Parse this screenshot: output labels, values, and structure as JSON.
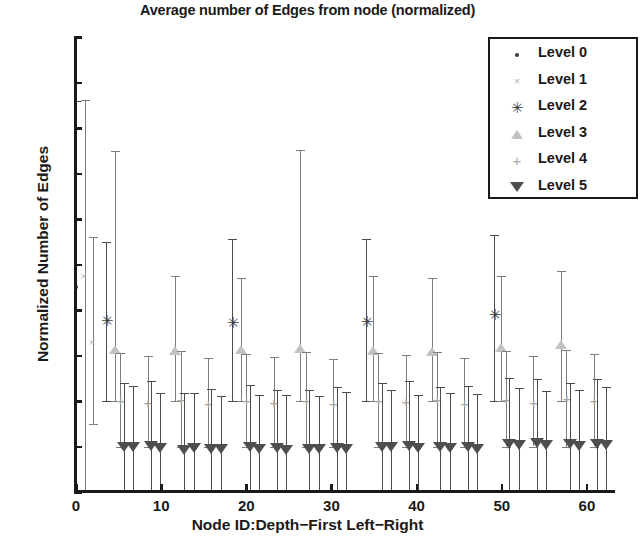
{
  "chart_data": {
    "type": "scatter",
    "title": "Average number of Edges from node (normalized)",
    "xlabel": "Node ID:Depth−First Left−Right",
    "ylabel": "Normalized Number of Edges",
    "xlim": [
      0,
      63.3
    ],
    "ylim": [
      0,
      0.2
    ],
    "xticks": [
      0,
      10,
      20,
      30,
      40,
      50,
      60
    ],
    "xticklabels": [
      "0",
      "10",
      "20",
      "30",
      "40",
      "50",
      "60"
    ],
    "yticks": [
      0,
      0.02,
      0.04,
      0.06,
      0.08,
      0.1,
      0.12,
      0.14,
      0.16,
      0.18,
      0.2
    ],
    "yticklabels": [
      "0",
      "0.02",
      "0.04",
      "0.06",
      "0.08",
      "0.1",
      "0.12",
      "0.14",
      "0.16",
      "0.18",
      "0.2"
    ],
    "grid": false,
    "legend_position": "upper right",
    "error_bars": "vertical, symmetric-ish (std-dev whiskers with caps)",
    "series": [
      {
        "name": "Level 0",
        "marker": "point",
        "color": "#3a3a3a",
        "x": [
          0
        ],
        "y": [
          0.0903
        ],
        "yerr_low": [
          0.0903
        ],
        "yerr_high": [
          0.0817
        ]
      },
      {
        "name": "Level 1",
        "marker": "x",
        "color": "#b4b4b4",
        "x": [
          1,
          2
        ],
        "y": [
          0.0945,
          0.0655
        ],
        "yerr_low": [
          0.0945,
          0.0355
        ],
        "yerr_high": [
          0.078,
          0.0465
        ]
      },
      {
        "name": "Level 2",
        "marker": "asterisk",
        "color": "#3c3c3c",
        "x": [
          3.5,
          18.3,
          34.0,
          49.1
        ],
        "y": [
          0.0752,
          0.0745,
          0.0748,
          0.0778
        ],
        "yerr_low": [
          0.0352,
          0.0345,
          0.0348,
          0.0378
        ],
        "yerr_high": [
          0.0348,
          0.0365,
          0.0362,
          0.0352
        ]
      },
      {
        "name": "Level 3",
        "marker": "triangle-up",
        "color": "#c2c2c2",
        "x": [
          4.6,
          11.6,
          19.4,
          26.3,
          34.9,
          41.8,
          49.9,
          57.0
        ],
        "y": [
          0.0625,
          0.0618,
          0.0622,
          0.063,
          0.062,
          0.0615,
          0.0635,
          0.0648
        ],
        "yerr_low": [
          0.0225,
          0.0218,
          0.0222,
          0.023,
          0.022,
          0.0215,
          0.0235,
          0.0248
        ],
        "yerr_high": [
          0.0875,
          0.0332,
          0.0318,
          0.0875,
          0.033,
          0.0325,
          0.0315,
          0.0322
        ]
      },
      {
        "name": "Level 4",
        "marker": "plus",
        "color": "#a8a8a8",
        "x": [
          5.2,
          8.4,
          12.3,
          15.5,
          20.0,
          23.2,
          27.0,
          30.2,
          35.5,
          38.7,
          42.4,
          45.6,
          50.5,
          53.7,
          57.6,
          60.8
        ],
        "y": [
          0.04,
          0.0392,
          0.0405,
          0.0388,
          0.0398,
          0.039,
          0.0402,
          0.0385,
          0.04,
          0.0395,
          0.0403,
          0.0388,
          0.0405,
          0.0392,
          0.0408,
          0.0398
        ],
        "yerr_low": [
          0.02,
          0.0192,
          0.0205,
          0.0188,
          0.0198,
          0.019,
          0.0202,
          0.0185,
          0.02,
          0.0195,
          0.0203,
          0.0188,
          0.0205,
          0.0192,
          0.0208,
          0.0198
        ],
        "yerr_high": [
          0.021,
          0.0205,
          0.0215,
          0.02,
          0.0208,
          0.0202,
          0.0212,
          0.0198,
          0.021,
          0.0206,
          0.0213,
          0.02,
          0.0215,
          0.0204,
          0.0217,
          0.021
        ]
      },
      {
        "name": "Level 5",
        "marker": "triangle-down",
        "color": "#4e4e4e",
        "x": [
          5.6,
          6.7,
          8.8,
          9.9,
          12.7,
          13.8,
          15.9,
          17.0,
          20.4,
          21.5,
          23.6,
          24.7,
          27.4,
          28.5,
          30.6,
          31.7,
          35.9,
          37.0,
          39.1,
          40.2,
          42.8,
          43.9,
          46.0,
          47.1,
          50.9,
          52.0,
          54.1,
          55.2,
          58.0,
          59.1,
          61.2,
          62.3
        ],
        "y": [
          0.02,
          0.0196,
          0.0202,
          0.0194,
          0.0186,
          0.0192,
          0.0188,
          0.019,
          0.0196,
          0.0188,
          0.0192,
          0.0186,
          0.019,
          0.0188,
          0.0192,
          0.019,
          0.02,
          0.0196,
          0.0202,
          0.0194,
          0.0198,
          0.0192,
          0.0196,
          0.019,
          0.0212,
          0.0208,
          0.0214,
          0.0206,
          0.021,
          0.0204,
          0.0212,
          0.0208
        ],
        "yerr_low": [
          0.02,
          0.0196,
          0.0202,
          0.0194,
          0.0186,
          0.0192,
          0.0188,
          0.019,
          0.0196,
          0.0188,
          0.0192,
          0.0186,
          0.019,
          0.0188,
          0.0192,
          0.019,
          0.02,
          0.0196,
          0.0202,
          0.0194,
          0.0198,
          0.0192,
          0.0196,
          0.019,
          0.0212,
          0.0208,
          0.0214,
          0.0206,
          0.021,
          0.0204,
          0.0212,
          0.0208
        ],
        "yerr_high": [
          0.028,
          0.027,
          0.0285,
          0.024,
          0.025,
          0.0245,
          0.0265,
          0.023,
          0.0275,
          0.0238,
          0.0255,
          0.0242,
          0.026,
          0.0235,
          0.0268,
          0.0248,
          0.0278,
          0.0252,
          0.0288,
          0.0232,
          0.0262,
          0.0244,
          0.0272,
          0.024,
          0.029,
          0.025,
          0.0282,
          0.0236,
          0.027,
          0.0246,
          0.0285,
          0.0255
        ]
      }
    ]
  },
  "legend": {
    "items": [
      {
        "label": "Level 0",
        "symbol": "·"
      },
      {
        "label": "Level 1",
        "symbol": "×"
      },
      {
        "label": "Level 2",
        "symbol": "✳"
      },
      {
        "label": "Level 3",
        "symbol": "△"
      },
      {
        "label": "Level 4",
        "symbol": "+"
      },
      {
        "label": "Level 5",
        "symbol": "▽"
      }
    ]
  }
}
